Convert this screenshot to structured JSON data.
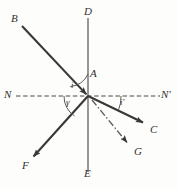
{
  "figure": {
    "kind": "optics-ray-diagram",
    "background_color": "#fdfdfc",
    "ink_color": "#3a3836",
    "width": 178,
    "height": 188
  },
  "points": {
    "D": {
      "label": "D",
      "x": 86,
      "y": 12
    },
    "E": {
      "label": "E",
      "x": 86,
      "y": 168
    },
    "A": {
      "label": "A",
      "x": 92,
      "y": 70
    },
    "B": {
      "label": "B",
      "x": 12,
      "y": 14
    },
    "C": {
      "label": "C",
      "x": 152,
      "y": 127
    },
    "F": {
      "label": "F",
      "x": 22,
      "y": 163
    },
    "G": {
      "label": "G",
      "x": 136,
      "y": 150
    },
    "N": {
      "label": "N",
      "x": 5,
      "y": 90
    },
    "Nprime": {
      "label": "N'",
      "x": 160,
      "y": 90
    }
  },
  "angles": {
    "i": {
      "label": "i",
      "x": 70,
      "y": 84
    },
    "gamma": {
      "label": "γ",
      "x": 66,
      "y": 98
    },
    "i_prime": {
      "label": "i'",
      "x": 120,
      "y": 99
    }
  },
  "lines": {
    "normal_DE": {
      "name": "normal-line",
      "x1": 88,
      "y1": 18,
      "x2": 88,
      "y2": 172,
      "style": "solid"
    },
    "surface_NN": {
      "name": "surface-line",
      "x1": 16,
      "y1": 96,
      "x2": 160,
      "y2": 96,
      "style": "dashed"
    },
    "incident_BO": {
      "name": "incident-ray",
      "x1": 22,
      "y1": 26,
      "x2": 88,
      "y2": 96,
      "style": "solid",
      "arrow": "at-origin"
    },
    "refracted_OC": {
      "name": "refracted-ray",
      "x1": 88,
      "y1": 96,
      "x2": 146,
      "y2": 124,
      "style": "solid",
      "arrow": "at-end"
    },
    "reflected_OF": {
      "name": "reflected-ray",
      "x1": 88,
      "y1": 96,
      "x2": 31,
      "y2": 159,
      "style": "solid",
      "arrow": "at-end"
    },
    "dashdot_OG": {
      "name": "dash-dot-ray",
      "x1": 92,
      "y1": 100,
      "x2": 130,
      "y2": 146,
      "style": "dash-dot",
      "arrow": "at-end"
    }
  },
  "arcs": {
    "arc_i": {
      "name": "angle-arc-i",
      "description": "arc between normal DA and incident ray on upper-left"
    },
    "arc_gamma": {
      "name": "angle-arc-gamma",
      "description": "arc between surface NN and reflected ray on lower-left"
    },
    "arc_i_prime": {
      "name": "angle-arc-i-prime",
      "description": "arc between surface NN' and refracted ray on lower-right"
    }
  }
}
